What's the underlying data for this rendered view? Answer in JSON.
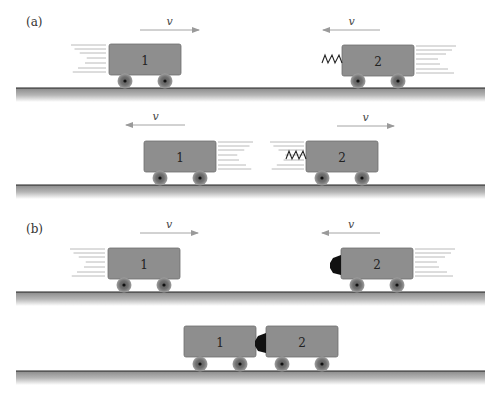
{
  "panels": [
    {
      "id": "a",
      "label": "(a)"
    },
    {
      "id": "b",
      "label": "(b)"
    }
  ],
  "colors": {
    "cart_fill": "#8e8e8e",
    "cart_stroke": "#6f6f6f",
    "wheel_fill": "#7a7a7a",
    "wheel_hub": "#111111",
    "ground_line": "#222222",
    "arrow": "#9a9a9a",
    "speed_lines": "#a8a8a8",
    "bumper": "#111111"
  },
  "velocity_symbol": "v",
  "rows": [
    {
      "name": "a-before",
      "ground_y": 88,
      "carts": [
        {
          "number": "1",
          "x": 109,
          "y": 44,
          "w": 72,
          "h": 31
        },
        {
          "number": "2",
          "x": 342,
          "y": 45,
          "w": 72,
          "h": 31
        }
      ],
      "arrows": [
        {
          "direction": "right",
          "x1": 140,
          "x2": 199,
          "y": 30,
          "label": "v"
        },
        {
          "direction": "left",
          "x1": 323,
          "x2": 380,
          "y": 30,
          "label": "v"
        }
      ],
      "attachment": {
        "type": "spring",
        "on_cart": "2",
        "side": "left"
      }
    },
    {
      "name": "a-after",
      "ground_y": 185,
      "carts": [
        {
          "number": "1",
          "x": 144,
          "y": 141,
          "w": 72,
          "h": 31
        },
        {
          "number": "2",
          "x": 306,
          "y": 141,
          "w": 72,
          "h": 31
        }
      ],
      "arrows": [
        {
          "direction": "left",
          "x1": 126,
          "x2": 185,
          "y": 125,
          "label": "v"
        },
        {
          "direction": "right",
          "x1": 337,
          "x2": 394,
          "y": 126,
          "label": "v"
        }
      ],
      "attachment": {
        "type": "spring",
        "on_cart": "2",
        "side": "left"
      }
    },
    {
      "name": "b-before",
      "ground_y": 292,
      "carts": [
        {
          "number": "1",
          "x": 108,
          "y": 248,
          "w": 72,
          "h": 31
        },
        {
          "number": "2",
          "x": 341,
          "y": 248,
          "w": 72,
          "h": 31
        }
      ],
      "arrows": [
        {
          "direction": "right",
          "x1": 140,
          "x2": 198,
          "y": 233,
          "label": "v"
        },
        {
          "direction": "left",
          "x1": 322,
          "x2": 380,
          "y": 233,
          "label": "v"
        }
      ],
      "attachment": {
        "type": "sticky-bumper",
        "on_cart": "2",
        "side": "left"
      }
    },
    {
      "name": "b-after",
      "ground_y": 371,
      "carts": [
        {
          "number": "1",
          "x": 184,
          "y": 326,
          "w": 72,
          "h": 31
        },
        {
          "number": "2",
          "x": 266,
          "y": 326,
          "w": 72,
          "h": 31
        }
      ],
      "arrows": [],
      "attachment": {
        "type": "sticky-bumper",
        "on_cart": "2",
        "side": "left"
      }
    }
  ]
}
